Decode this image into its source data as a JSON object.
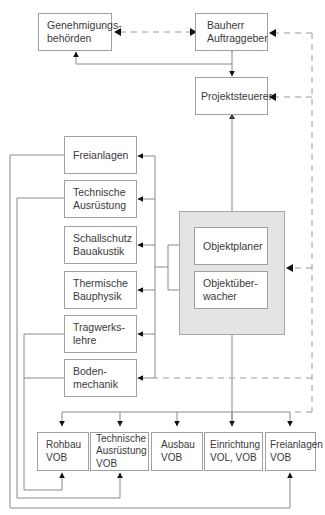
{
  "diagram": {
    "top": {
      "genehmigungsbehoerden": {
        "line1": "Genehmigungs-",
        "line2": "behörden"
      },
      "bauherr": {
        "line1": "Bauherr",
        "line2": "Auftraggeber"
      },
      "projektsteuerer": {
        "line1": "Projektsteuerer"
      }
    },
    "fachplaner": [
      {
        "line1": "Freianlagen",
        "line2": ""
      },
      {
        "line1": "Technische",
        "line2": "Ausrüstung"
      },
      {
        "line1": "Schallschutz",
        "line2": "Bauakustik"
      },
      {
        "line1": "Thermische",
        "line2": "Bauphysik"
      },
      {
        "line1": "Tragwerks-",
        "line2": "lehre"
      },
      {
        "line1": "Boden-",
        "line2": "mechanik"
      }
    ],
    "objekt": {
      "planer": {
        "line1": "Objektplaner"
      },
      "ueberwacher": {
        "line1": "Objektüber-",
        "line2": "wacher"
      }
    },
    "gewerke": [
      {
        "line1": "Rohbau",
        "line2": "VOB",
        "line3": ""
      },
      {
        "line1": "Technische",
        "line2": "Ausrüstung",
        "line3": "VOB"
      },
      {
        "line1": "Ausbau",
        "line2": "VOB",
        "line3": ""
      },
      {
        "line1": "Einrichtung",
        "line2": "VOL, VOB",
        "line3": ""
      },
      {
        "line1": "Freianlagen",
        "line2": "VOB",
        "line3": ""
      }
    ],
    "colors": {
      "line": "#8a8a8a",
      "arrow": "#111111",
      "dashed": "#9a9a9a",
      "group": "#e4e4e4"
    }
  }
}
